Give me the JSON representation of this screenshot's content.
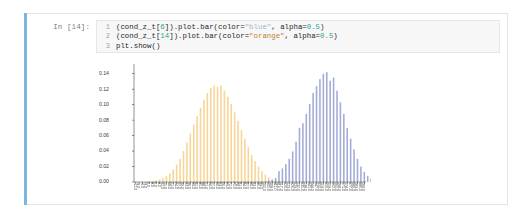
{
  "notebook": {
    "prompt_label": "In [14]:",
    "code_lines": [
      {
        "number": "1",
        "tokens": [
          {
            "t": "(cond_z_t[",
            "k": "plain"
          },
          {
            "t": "6",
            "k": "num"
          },
          {
            "t": "]).plot.bar(color=",
            "k": "plain"
          },
          {
            "t": "\"blue\"",
            "k": "strb"
          },
          {
            "t": ", alpha=",
            "k": "plain"
          },
          {
            "t": "0.5",
            "k": "num"
          },
          {
            "t": ")",
            "k": "plain"
          }
        ]
      },
      {
        "number": "2",
        "tokens": [
          {
            "t": "(cond_z_t[",
            "k": "plain"
          },
          {
            "t": "14",
            "k": "num"
          },
          {
            "t": "]).plot.bar(color=",
            "k": "plain"
          },
          {
            "t": "\"orange\"",
            "k": "str"
          },
          {
            "t": ", alpha=",
            "k": "plain"
          },
          {
            "t": "0.5",
            "k": "num"
          },
          {
            "t": ")",
            "k": "plain"
          }
        ]
      },
      {
        "number": "3",
        "tokens": [
          {
            "t": "plt.show()",
            "k": "plain"
          }
        ]
      }
    ]
  },
  "colors": {
    "cell_selected_bar": "#7cb7e0",
    "cell_border": "#e3e3e3",
    "code_background": "#f7f7f7",
    "series_orange": "#f5c97a",
    "series_blue": "#8b93c9",
    "axis": "#4a4a4a",
    "plot_background": "#ffffff"
  },
  "chart_data": {
    "type": "bar",
    "title": "",
    "xlabel": "",
    "ylabel": "",
    "ylim": [
      0,
      0.15
    ],
    "grid": false,
    "legend": null,
    "ytick_labels": [
      "0.00",
      "0.02",
      "0.04",
      "0.06",
      "0.08",
      "0.10",
      "0.12",
      "0.14"
    ],
    "ytick_values": [
      0.0,
      0.02,
      0.04,
      0.06,
      0.08,
      0.1,
      0.12,
      0.14
    ],
    "x_tick_count": 68,
    "xtick_labels_legible": false,
    "series": [
      {
        "name": "cond_z_t[14]",
        "color": "#f5c97a",
        "alpha": 0.5,
        "x_start_index": 3,
        "values": [
          0.0005,
          0.0008,
          0.0012,
          0.002,
          0.0032,
          0.005,
          0.0075,
          0.011,
          0.016,
          0.0225,
          0.03,
          0.04,
          0.051,
          0.0625,
          0.074,
          0.0855,
          0.096,
          0.106,
          0.115,
          0.1215,
          0.125,
          0.123,
          0.1245,
          0.118,
          0.11,
          0.101,
          0.09,
          0.079,
          0.067,
          0.056,
          0.045,
          0.035,
          0.027,
          0.02,
          0.014,
          0.0095,
          0.006,
          0.0035,
          0.002,
          0.0012,
          0.0006
        ]
      },
      {
        "name": "cond_z_t[6]",
        "color": "#8b93c9",
        "alpha": 0.5,
        "x_start_index": 37,
        "values": [
          0.0005,
          0.001,
          0.0018,
          0.003,
          0.0052,
          0.014,
          0.0175,
          0.023,
          0.03,
          0.0395,
          0.052,
          0.07,
          0.076,
          0.088,
          0.101,
          0.115,
          0.124,
          0.133,
          0.14,
          0.142,
          0.131,
          0.135,
          0.118,
          0.103,
          0.088,
          0.07,
          0.056,
          0.042,
          0.03,
          0.02,
          0.013,
          0.008,
          0.0045,
          0.0025,
          0.0012,
          0.0006
        ]
      }
    ]
  }
}
